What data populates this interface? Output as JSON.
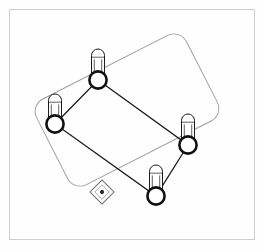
{
  "viewport": {
    "title": "3D Model Viewport",
    "background_color": "#ffffff",
    "frame_color": "#cfcfcf",
    "width": 265,
    "height": 250
  },
  "drawing": {
    "name": "bolted-plate-assembly",
    "description": "Isometric wireframe of a rectangular plate with four bolts",
    "plate": {
      "name": "mounting-plate",
      "stroke_color": "#9a9a9a",
      "stroke_width": 0.9,
      "corner_radius": 14,
      "rotation_deg": -27,
      "center_x": 127,
      "center_y": 110,
      "width": 168,
      "height": 96
    },
    "bolt_frame": {
      "name": "bolt-hole-pattern",
      "stroke_color": "#1b1b1b",
      "stroke_width": 1.3,
      "points": [
        [
          98,
          80
        ],
        [
          188,
          145
        ],
        [
          156,
          196
        ],
        [
          55,
          124
        ]
      ]
    },
    "bolts": [
      {
        "id": "bolt-top",
        "label": "Bolt 1",
        "cx": 98,
        "cy": 80,
        "shaft_top": 49,
        "shaft_width": 13,
        "nut_radius": 9.5
      },
      {
        "id": "bolt-left",
        "label": "Bolt 2",
        "cx": 55,
        "cy": 124,
        "shaft_top": 94,
        "shaft_width": 13,
        "nut_radius": 9.5
      },
      {
        "id": "bolt-right",
        "label": "Bolt 3",
        "cx": 188,
        "cy": 145,
        "shaft_top": 114,
        "shaft_width": 13,
        "nut_radius": 9.5
      },
      {
        "id": "bolt-bottom",
        "label": "Bolt 4",
        "cx": 156,
        "cy": 196,
        "shaft_top": 165,
        "shaft_width": 13,
        "nut_radius": 9.5
      }
    ],
    "origin_marker": {
      "name": "ucs-origin-marker",
      "cx": 102,
      "cy": 192,
      "size": 17,
      "rotation_deg": 45,
      "stroke_color": "#6e6e6e"
    }
  },
  "colors": {
    "line_dark": "#1b1b1b",
    "line_light": "#9a9a9a",
    "nut_fill": "#ffffff",
    "shaft_fill": "#ffffff",
    "frame": "#cfcfcf"
  }
}
